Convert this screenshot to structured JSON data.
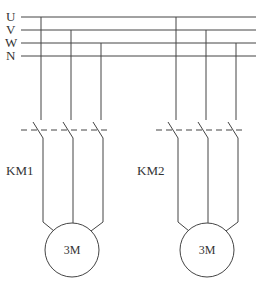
{
  "diagram": {
    "colors": {
      "line": "#444444",
      "text": "#333333",
      "background": "#ffffff"
    },
    "buses": [
      {
        "label": "U",
        "y": 17
      },
      {
        "label": "V",
        "y": 30
      },
      {
        "label": "W",
        "y": 43
      },
      {
        "label": "N",
        "y": 56
      }
    ],
    "contactors": [
      {
        "label": "KM1",
        "phases_x": [
          41,
          71,
          101
        ],
        "motor_label": "3M",
        "motor_cx": 72
      },
      {
        "label": "KM2",
        "phases_x": [
          176,
          206,
          236
        ],
        "motor_label": "3M",
        "motor_cx": 206
      }
    ]
  }
}
